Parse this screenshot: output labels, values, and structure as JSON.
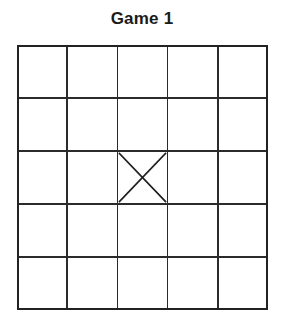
{
  "page": {
    "title": "Game 1",
    "background_color": "#ffffff"
  },
  "board": {
    "name": "game-grid",
    "rows": 5,
    "columns": 5,
    "line_color": "#2b2b2b",
    "border_color": "#222222",
    "cell_fill": "#ffffff",
    "geometry": {
      "left": 17,
      "top": 45,
      "width": 251,
      "height": 265,
      "cell_width": 50.2,
      "cell_height": 53.0
    },
    "marks": [
      {
        "symbol": "X",
        "row": 3,
        "column": 3,
        "row_index": 2,
        "column_index": 2,
        "color": "#1f1f1f"
      }
    ],
    "cells": [
      [
        "",
        "",
        "",
        "",
        ""
      ],
      [
        "",
        "",
        "",
        "",
        ""
      ],
      [
        "",
        "",
        "X",
        "",
        ""
      ],
      [
        "",
        "",
        "",
        "",
        ""
      ],
      [
        "",
        "",
        "",
        "",
        ""
      ]
    ]
  }
}
